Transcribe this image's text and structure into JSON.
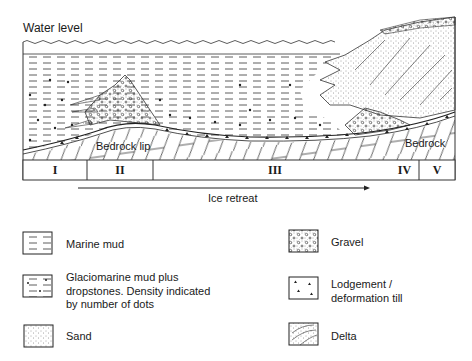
{
  "diagram": {
    "water_level_label": "Water level",
    "bedrock_lip_label": "Bedrock lip",
    "bedrock_label": "Bedrock",
    "zones": [
      "I",
      "II",
      "III",
      "IV",
      "V"
    ],
    "arrow_label": "Ice retreat"
  },
  "legend": {
    "items": [
      {
        "id": "marine-mud",
        "label": "Marine mud"
      },
      {
        "id": "glaciomarine-mud",
        "label_lines": [
          "Glaciomarine mud plus",
          "dropstones. Density indicated",
          "by number of dots"
        ]
      },
      {
        "id": "sand",
        "label": "Sand"
      },
      {
        "id": "gravel",
        "label": "Gravel"
      },
      {
        "id": "till",
        "label_lines": [
          "Lodgement /",
          "deformation till"
        ]
      },
      {
        "id": "delta",
        "label": "Delta"
      }
    ]
  }
}
